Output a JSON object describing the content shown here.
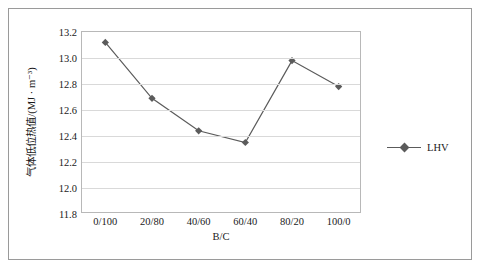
{
  "chart_data": {
    "type": "line",
    "title": "",
    "xlabel": "B/C",
    "ylabel": "气体低位热值/(MJ · m⁻³)",
    "categories": [
      "0/100",
      "20/80",
      "40/60",
      "60/40",
      "80/20",
      "100/0"
    ],
    "series": [
      {
        "name": "LHV",
        "values": [
          13.12,
          12.69,
          12.44,
          12.35,
          12.98,
          12.78
        ],
        "color": "#5b5b5b",
        "marker": "diamond"
      }
    ],
    "ylim": [
      11.8,
      13.2
    ],
    "yticks": [
      "11.8",
      "12.0",
      "12.2",
      "12.4",
      "12.6",
      "12.8",
      "13.0",
      "13.2"
    ],
    "ytick_values": [
      11.8,
      12.0,
      12.2,
      12.4,
      12.6,
      12.8,
      13.0,
      13.2
    ],
    "grid": "horizontal",
    "legend_position": "right",
    "legend_entries": [
      "LHV"
    ]
  }
}
